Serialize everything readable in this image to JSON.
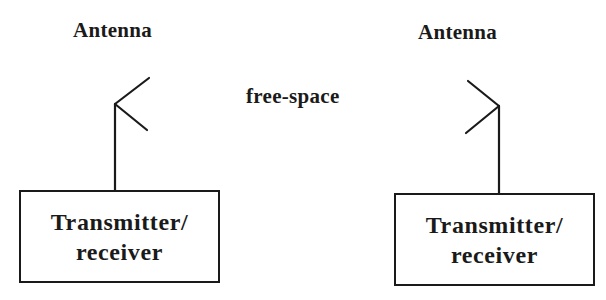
{
  "diagram": {
    "left_node": {
      "antenna_label": "Antenna",
      "box_line1": "Transmitter/",
      "box_line2": "receiver"
    },
    "medium": {
      "label": "free-space"
    },
    "right_node": {
      "antenna_label": "Antenna",
      "box_line1": "Transmitter/",
      "box_line2": "receiver"
    },
    "colors": {
      "stroke": "#1a1a1a",
      "background": "#ffffff"
    }
  }
}
